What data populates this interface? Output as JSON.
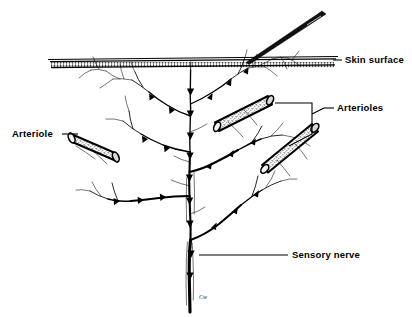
{
  "figure": {
    "background_color": "#ffffff",
    "ink_color": "#000000",
    "signature": "Cw"
  },
  "labels": {
    "skin_surface": "Skin surface",
    "arterioles": "Arterioles",
    "arteriole": "Arteriole",
    "sensory_nerve": "Sensory nerve"
  },
  "structures": {
    "skin_surface_name": "skin-surface-line",
    "needle_name": "needle",
    "nerve_name": "sensory-nerve-tree",
    "arteriole_left_name": "arteriole-left",
    "arteriole_upper_right_name": "arteriole-upper-right",
    "arteriole_lower_right_name": "arteriole-lower-right"
  }
}
